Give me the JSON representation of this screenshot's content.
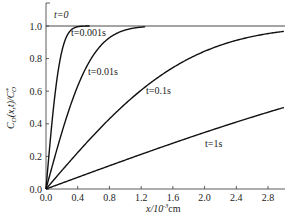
{
  "chart_data": {
    "type": "line",
    "title": "",
    "xlabel": "x/10^-3 cm",
    "ylabel": "C_O(x,t)/C*_O",
    "xlim": [
      0.0,
      3.0
    ],
    "ylim": [
      0.0,
      1.05
    ],
    "grid": false,
    "legend": "inline curve labels",
    "x_ticks": [
      "0.0",
      "0.4",
      "0.8",
      "1.2",
      "1.6",
      "2.0",
      "2.4",
      "2.8"
    ],
    "y_ticks": [
      "0.0",
      "0.2",
      "0.4",
      "0.6",
      "0.8",
      "1.0"
    ],
    "x": [
      0.0,
      0.1,
      0.2,
      0.3,
      0.4,
      0.5,
      0.6,
      0.8,
      1.0,
      1.2,
      1.4,
      1.6,
      1.8,
      2.0,
      2.2,
      2.4,
      2.6,
      2.8,
      3.0
    ],
    "series": [
      {
        "name": "t=0",
        "values": [
          1.0,
          1.0,
          1.0,
          1.0,
          1.0,
          1.0,
          1.0,
          1.0,
          1.0,
          1.0,
          1.0,
          1.0,
          1.0,
          1.0,
          1.0,
          1.0,
          1.0,
          1.0,
          1.0
        ]
      },
      {
        "name": "t=0.001s",
        "values": [
          0.0,
          0.52,
          0.84,
          0.97,
          1.0,
          1.0,
          1.0,
          1.0,
          1.0,
          1.0,
          1.0,
          1.0,
          1.0,
          1.0,
          1.0,
          1.0,
          1.0,
          1.0,
          1.0
        ]
      },
      {
        "name": "t=0.01s",
        "values": [
          0.0,
          0.18,
          0.35,
          0.5,
          0.63,
          0.74,
          0.82,
          0.93,
          0.98,
          0.99,
          1.0,
          1.0,
          1.0,
          1.0,
          1.0,
          1.0,
          1.0,
          1.0,
          1.0
        ]
      },
      {
        "name": "t=0.1s",
        "values": [
          0.0,
          0.06,
          0.11,
          0.17,
          0.22,
          0.28,
          0.33,
          0.43,
          0.52,
          0.6,
          0.68,
          0.74,
          0.8,
          0.84,
          0.88,
          0.91,
          0.94,
          0.95,
          0.97
        ]
      },
      {
        "name": "t=1s",
        "values": [
          0.0,
          0.02,
          0.04,
          0.05,
          0.07,
          0.09,
          0.11,
          0.14,
          0.18,
          0.21,
          0.25,
          0.28,
          0.31,
          0.34,
          0.37,
          0.41,
          0.44,
          0.47,
          0.5
        ]
      }
    ],
    "diffusion_scale": {
      "t=0.001s": 0.199,
      "t=0.01s": 0.629,
      "t=0.1s": 1.99,
      "t=1s": 6.29
    }
  },
  "labels": {
    "t0": "t=0",
    "t0001": "t=0.001s",
    "t001": "t=0.01s",
    "t01": "t=0.1s",
    "t1": "t=1s"
  },
  "axes": {
    "xlabel_main": "x/10",
    "xlabel_exp": "-3",
    "xlabel_unit": "cm",
    "ylabel": "C_O(x,t)/C*_O"
  }
}
